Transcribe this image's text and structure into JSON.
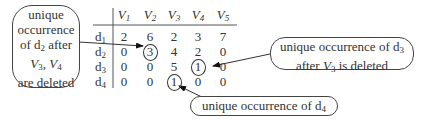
{
  "table": {
    "columns": [
      "V1",
      "V2",
      "V3",
      "V4",
      "V5"
    ],
    "rows": [
      {
        "label": "d1",
        "values": [
          "2",
          "6",
          "2",
          "3",
          "7"
        ]
      },
      {
        "label": "d2",
        "values": [
          "0",
          "3",
          "4",
          "2",
          "0"
        ]
      },
      {
        "label": "d3",
        "values": [
          "0",
          "0",
          "5",
          "1",
          "0"
        ]
      },
      {
        "label": "d4",
        "values": [
          "0",
          "0",
          "1",
          "0",
          "0"
        ]
      }
    ],
    "circled_cells": [
      {
        "row": "d2",
        "col": "V2",
        "value": "3"
      },
      {
        "row": "d3",
        "col": "V4",
        "value": "1"
      },
      {
        "row": "d4",
        "col": "V3",
        "value": "1"
      }
    ]
  },
  "callouts": {
    "d2": {
      "lines": [
        "unique",
        "occurrence",
        "of d2 after",
        "V3, V4",
        "are deleted"
      ]
    },
    "d3": {
      "lines": [
        "unique occurrence of d3",
        "after V3 is deleted"
      ]
    },
    "d4": {
      "lines": [
        "unique occurrence of d4"
      ]
    }
  }
}
